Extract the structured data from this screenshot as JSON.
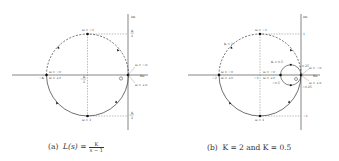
{
  "figure": {
    "panels": [
      {
        "id": "a",
        "caption_prefix": "(a)",
        "caption_expr": "L(s) =",
        "caption_num": "K",
        "caption_den": "s − 1",
        "axis_labels": {
          "re": "Re",
          "im": "Im"
        },
        "labels": {
          "top_omega": "ω = −1",
          "bottom_omega": "ω = 1",
          "left_omega_top": "ω = −0",
          "left_omega_bot": "ω = +0",
          "left_value": "−K",
          "mid_value_num": "K",
          "mid_value_den": "2",
          "mid_value_sign": "−",
          "right_top": "ω = −∞",
          "right_bot": "ω = +∞",
          "im_top_num": "K",
          "im_top_den": "2",
          "im_bot_num": "K",
          "im_bot_den": "2",
          "im_bot_sign": "−",
          "origin": "O"
        }
      },
      {
        "id": "b",
        "caption_prefix": "(b)",
        "caption_text": "K = 2 and  K = 0.5",
        "axis_labels": {
          "re": "Re",
          "im": "Im"
        },
        "labels": {
          "k_large": "K = 2",
          "k_small": "K = 0.5",
          "top_omega": "ω = −1",
          "bottom_omega": "ω = 1",
          "left_omega_top": "ω = −0",
          "left_omega_bot": "ω = +0",
          "left_value": "−2",
          "mid_value": "−1",
          "small_left_top": "ω = −0",
          "small_left_bot": "ω = +0",
          "small_left_value": "−0.5",
          "im_top_large": "1",
          "im_bot_large": "−1",
          "im_top_small": "0.25",
          "im_bot_small": "−0.25",
          "right_top": "ω = −∞",
          "right_bot": "ω = +∞",
          "origin": "O"
        }
      }
    ]
  }
}
